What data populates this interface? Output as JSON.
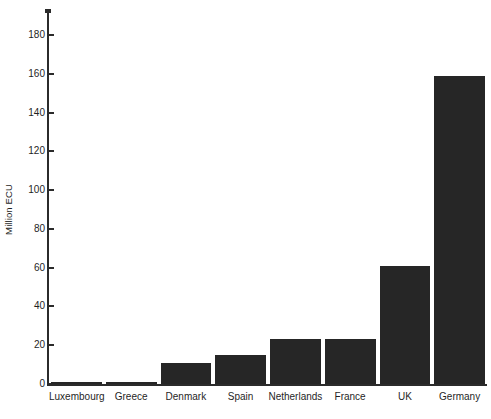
{
  "chart_data": {
    "type": "bar",
    "title": "",
    "xlabel": "",
    "ylabel": "Million ECU",
    "categories": [
      "Luxembourg",
      "Greece",
      "Denmark",
      "Spain",
      "Netherlands",
      "France",
      "UK",
      "Germany"
    ],
    "values": [
      1,
      1,
      11,
      15,
      23,
      23,
      61,
      159
    ],
    "ylim": [
      0,
      193
    ],
    "yticks": [
      0,
      20,
      40,
      60,
      80,
      100,
      120,
      140,
      160,
      180
    ],
    "ytick_labels": [
      "0",
      "20",
      "40",
      "60",
      "80",
      "100",
      "120",
      "140",
      "160",
      "180"
    ],
    "grid": false,
    "legend": null,
    "series": [
      {
        "name": "Million ECU",
        "values": [
          1,
          1,
          11,
          15,
          23,
          23,
          61,
          159
        ]
      }
    ],
    "bar_color": "#262626",
    "axis_color": "#2b2b2b",
    "background_color": "#ffffff"
  },
  "axis": {
    "y_title": "Million ECU"
  }
}
